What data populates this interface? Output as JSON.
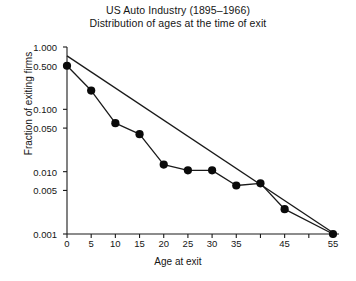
{
  "chart_data": {
    "type": "line",
    "title": "US Auto Industry (1895–1966)",
    "subtitle": "Distribution of ages at the time of exit",
    "xlabel": "Age at exit",
    "ylabel": "Fraction of exiting firms",
    "yscale": "log",
    "xlim": [
      0,
      57
    ],
    "ylim": [
      0.001,
      1.0
    ],
    "grid": false,
    "legend": null,
    "x": [
      0,
      5,
      10,
      15,
      20,
      25,
      30,
      35,
      40,
      45,
      55
    ],
    "values": [
      0.5,
      0.2,
      0.06,
      0.04,
      0.013,
      0.0105,
      0.0105,
      0.006,
      0.0065,
      0.0025,
      0.001
    ],
    "series": [
      {
        "name": "Observed exit fractions",
        "marker": "filled-circle",
        "x": [
          0,
          5,
          10,
          15,
          20,
          25,
          30,
          35,
          40,
          45,
          55
        ],
        "values": [
          0.5,
          0.2,
          0.06,
          0.04,
          0.013,
          0.0105,
          0.0105,
          0.006,
          0.0065,
          0.0025,
          0.001
        ]
      },
      {
        "name": "Exponential fit",
        "marker": "none",
        "x": [
          0,
          55
        ],
        "values": [
          0.72,
          0.00105
        ]
      }
    ],
    "y_ticks": [
      {
        "value": 1.0,
        "label": "1.000"
      },
      {
        "value": 0.5,
        "label": "0.500"
      },
      {
        "value": 0.1,
        "label": "0.100"
      },
      {
        "value": 0.05,
        "label": "0.050"
      },
      {
        "value": 0.01,
        "label": "0.010"
      },
      {
        "value": 0.005,
        "label": "0.005"
      },
      {
        "value": 0.001,
        "label": "0.001"
      }
    ],
    "x_ticks": [
      {
        "value": 0,
        "label": "0"
      },
      {
        "value": 5,
        "label": "5"
      },
      {
        "value": 10,
        "label": "10"
      },
      {
        "value": 15,
        "label": "15"
      },
      {
        "value": 20,
        "label": "20"
      },
      {
        "value": 25,
        "label": "25"
      },
      {
        "value": 30,
        "label": "30"
      },
      {
        "value": 35,
        "label": "35"
      },
      {
        "value": 40,
        "label": ""
      },
      {
        "value": 45,
        "label": "45"
      },
      {
        "value": 50,
        "label": ""
      },
      {
        "value": 55,
        "label": "55"
      }
    ],
    "colors": {
      "axis": "#1a1a1a",
      "marker": "#0a0a0a",
      "data_line": "#1a1a1a",
      "fit_line": "#1a1a1a",
      "background": "#ffffff"
    }
  }
}
